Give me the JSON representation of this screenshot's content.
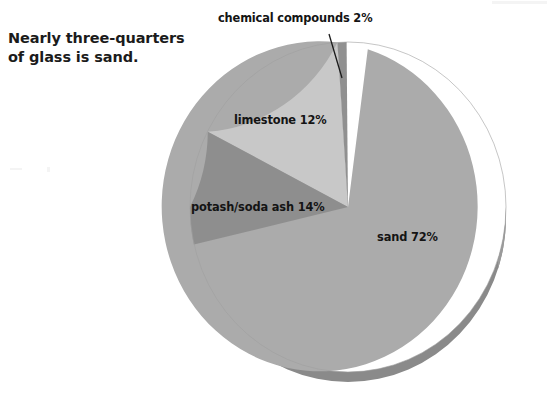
{
  "caption": {
    "text": "Nearly three-quarters\nof glass is sand."
  },
  "chart_data": {
    "type": "pie",
    "title": "Nearly three-quarters of glass is sand.",
    "xlabel": "",
    "ylabel": "",
    "legend_position": "none",
    "grid": false,
    "units": "percent",
    "categories": [
      "sand",
      "potash/soda ash",
      "limestone",
      "chemical compounds"
    ],
    "values": [
      72,
      14,
      12,
      2
    ],
    "labels": [
      "sand 72%",
      "potash/soda ash 14%",
      "limestone 12%",
      "chemical compounds 2%"
    ],
    "colors": [
      "#ababab",
      "#8e8e8e",
      "#c8c8c8",
      "#909090"
    ],
    "slices": [
      {
        "name": "chemical compounds",
        "value": 2,
        "label": "chemical compounds 2%",
        "color": "#909090",
        "label_x": 218,
        "label_y": 22,
        "label_anchor": "start",
        "leader": true
      },
      {
        "name": "sand",
        "value": 72,
        "label": "sand 72%",
        "color": "#ababab",
        "label_x": 377,
        "label_y": 241,
        "label_anchor": "start",
        "leader": false
      },
      {
        "name": "potash/soda ash",
        "value": 14,
        "label": "potash/soda ash 14%",
        "color": "#8e8e8e",
        "label_x": 191,
        "label_y": 211,
        "label_anchor": "start",
        "leader": false
      },
      {
        "name": "limestone",
        "value": 12,
        "label": "limestone 12%",
        "color": "#c8c8c8",
        "label_x": 234,
        "label_y": 124,
        "label_anchor": "start",
        "leader": false
      }
    ]
  },
  "style": {
    "background": "#ffffff",
    "text_color": "#141414",
    "depth_shadow": "#8a8a8a",
    "leader_line": "#1a1a1a"
  }
}
